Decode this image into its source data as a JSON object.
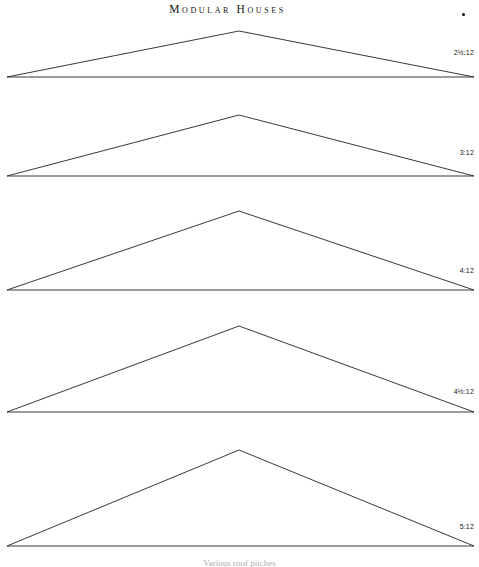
{
  "page": {
    "title": "Modular Houses",
    "background_color": "#ffffff",
    "line_color": "#232323",
    "width": 479,
    "height": 567
  },
  "header": {
    "title": "Modular Houses",
    "corner_marker": "bullet-dot"
  },
  "diagram": {
    "caption_partial": "Various roof pitches",
    "pitches": [
      {
        "label": "2½:12",
        "ratio_rise": "2½",
        "ratio_run": "12",
        "peak_x": 239,
        "peak_y": 31,
        "base_y": 77,
        "left_x": 7,
        "right_x": 474,
        "label_x": 474,
        "label_y": 48
      },
      {
        "label": "3:12",
        "ratio_rise": "3",
        "ratio_run": "12",
        "peak_x": 239,
        "peak_y": 115,
        "base_y": 176,
        "left_x": 7,
        "right_x": 474,
        "label_x": 474,
        "label_y": 148
      },
      {
        "label": "4:12",
        "ratio_rise": "4",
        "ratio_run": "12",
        "peak_x": 239,
        "peak_y": 211,
        "base_y": 290,
        "left_x": 7,
        "right_x": 474,
        "label_x": 474,
        "label_y": 266
      },
      {
        "label": "4½:12",
        "ratio_rise": "4½",
        "ratio_run": "12",
        "peak_x": 239,
        "peak_y": 326,
        "base_y": 412,
        "left_x": 7,
        "right_x": 474,
        "label_x": 474,
        "label_y": 387
      },
      {
        "label": "5:12",
        "ratio_rise": "5",
        "ratio_run": "12",
        "peak_x": 239,
        "peak_y": 450,
        "base_y": 546,
        "left_x": 7,
        "right_x": 474,
        "label_x": 474,
        "label_y": 522
      }
    ]
  }
}
